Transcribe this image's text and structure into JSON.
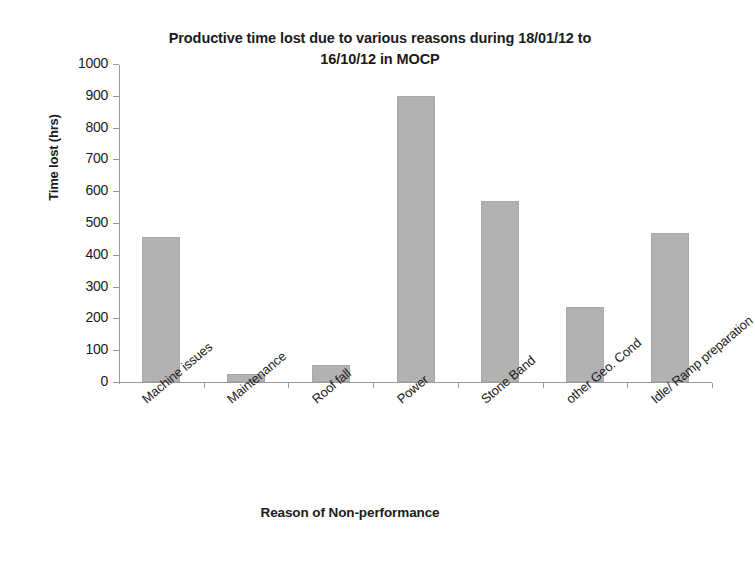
{
  "chart_data": {
    "type": "bar",
    "title": "Productive time lost due to various reasons during 18/01/12 to\n16/10/12 in MOCP",
    "xlabel": "Reason of Non-performance",
    "ylabel": "Time lost (hrs)",
    "categories": [
      "Machine issues",
      "Maintenance",
      "Roof fall",
      "Power",
      "Stone Band",
      "other Geo. Cond",
      "Idle/ Ramp preparation"
    ],
    "values": [
      455,
      25,
      52,
      900,
      570,
      237,
      468
    ],
    "ylim": [
      0,
      1000
    ],
    "ytick_labels": [
      "1000",
      "900",
      "800",
      "700",
      "600",
      "500",
      "400",
      "300",
      "200",
      "100",
      "0"
    ],
    "ytick_values": [
      1000,
      900,
      800,
      700,
      600,
      500,
      400,
      300,
      200,
      100,
      0
    ],
    "ytick_step": 100,
    "grid": false,
    "legend": false,
    "series_color": "#b2b2b2",
    "axis_color": "#9a9a9a",
    "text_color": "#1b1b1b"
  }
}
